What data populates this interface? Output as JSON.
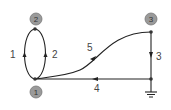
{
  "diagram": {
    "type": "directed-graph",
    "nodes": [
      {
        "id": "1",
        "label": "1",
        "vertex": [
          35,
          79
        ],
        "badge": [
          36,
          92
        ]
      },
      {
        "id": "2",
        "label": "2",
        "vertex": [
          35,
          29
        ],
        "badge": [
          36,
          19
        ]
      },
      {
        "id": "3",
        "label": "3",
        "vertex": [
          151,
          32
        ],
        "badge": [
          151,
          19
        ]
      },
      {
        "id": "g",
        "label": "",
        "vertex": [
          151,
          79
        ],
        "ground": true
      }
    ],
    "edges": [
      {
        "id": "1",
        "label": "1",
        "from": "2",
        "to": "1",
        "shape": "left-arc"
      },
      {
        "id": "2",
        "label": "2",
        "from": "1",
        "to": "2",
        "shape": "right-arc"
      },
      {
        "id": "3",
        "label": "3",
        "from": "3",
        "to": "g",
        "shape": "straight"
      },
      {
        "id": "4",
        "label": "4",
        "from": "g",
        "to": "1",
        "shape": "straight"
      },
      {
        "id": "5",
        "label": "5",
        "from": "3",
        "to": "1",
        "shape": "curve"
      }
    ],
    "colors": {
      "line": "#222222",
      "node_fill": "#9a9a9a",
      "node_stroke": "#777777",
      "label": "#444444"
    }
  }
}
